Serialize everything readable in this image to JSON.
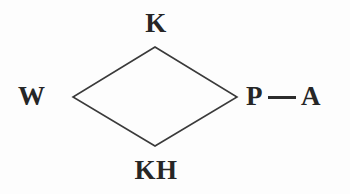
{
  "figure": {
    "type": "node-diagram",
    "background_color": "#fdfdfd",
    "stroke_color": "#3a3a3a",
    "text_color": "#262626"
  },
  "nodes": {
    "top": {
      "label": "K",
      "position": "top-vertex"
    },
    "left": {
      "label": "W",
      "position": "left-vertex"
    },
    "bottom": {
      "label": "KH",
      "position": "bottom-vertex"
    },
    "right": {
      "label": "P",
      "position": "right-vertex"
    },
    "external": {
      "label": "A",
      "position": "right-outer"
    }
  },
  "connector": {
    "name": "p-to-a-dash",
    "glyph": "—",
    "color": "#2c2c2c"
  },
  "shape": {
    "name": "diamond",
    "vertices": [
      {
        "x": 155,
        "y": 47
      },
      {
        "x": 237,
        "y": 97
      },
      {
        "x": 155,
        "y": 146
      },
      {
        "x": 73,
        "y": 97
      }
    ],
    "stroke_width": 1.6
  }
}
